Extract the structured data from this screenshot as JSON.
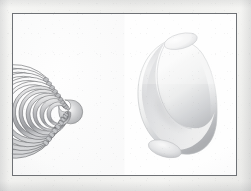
{
  "figure": {
    "caption": "",
    "background_color": "#f2f2f0",
    "plate_color": "#ffffff",
    "frame_color": "#6e7175",
    "frame": {
      "x": 12,
      "y": 13,
      "width": 225,
      "height": 163
    },
    "panel_count": 2
  },
  "panels": [
    {
      "id": "contour-slices",
      "name": "left-panel",
      "label": "",
      "description": "bent tube rendered as stacked nested contour slices",
      "shape": "torus-segment",
      "render_style": "contour-slices",
      "slice_count": 11,
      "sweep_degrees": 260,
      "line_color": "#3c3e42",
      "fill_light": "#fdfdfd",
      "fill_mid": "#c9cacc",
      "fill_dark": "#7e8084",
      "center": {
        "x": 62,
        "y": 94
      },
      "radii_outer": [
        46,
        42,
        38,
        34,
        30.5,
        27,
        23.5,
        20,
        17,
        14,
        11.5
      ],
      "band_width": 3.2
    },
    {
      "id": "shaded-solid",
      "name": "right-panel",
      "label": "",
      "description": "same bent tube rendered as a smooth shaded solid elbow",
      "shape": "torus-segment",
      "render_style": "smooth-shaded",
      "sweep_degrees": 250,
      "highlight_color": "#ffffff",
      "midtone_color": "#e3e4e6",
      "shadow_color": "#97999d",
      "outline_color": "#b7b9bc",
      "center": {
        "x": 180,
        "y": 94
      },
      "outer_radius": 44,
      "tube_radius": 15
    }
  ],
  "chart_data": {
    "type": "diagram",
    "title": "",
    "xlabel": "",
    "ylabel": "",
    "legend": [],
    "annotations": []
  }
}
